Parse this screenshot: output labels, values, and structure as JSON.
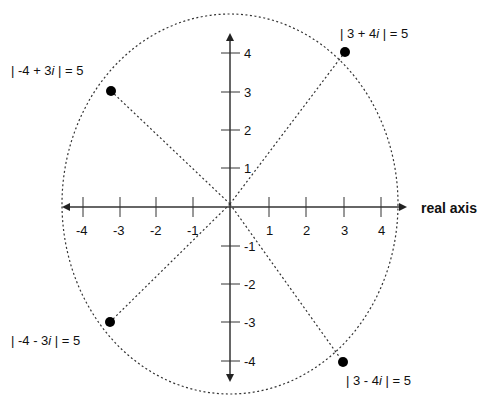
{
  "diagram": {
    "title_partial": "imaginary axis",
    "x_axis_label": "real axis",
    "x_ticks": [
      "-4",
      "-3",
      "-2",
      "-1",
      "1",
      "2",
      "3",
      "4"
    ],
    "y_ticks": [
      "4",
      "3",
      "2",
      "1",
      "-1",
      "-2",
      "-3",
      "-4"
    ],
    "points": [
      {
        "label_pre": "| 3 + 4",
        "label_i": "i",
        "label_post": " | = 5",
        "re": 3,
        "im": 4
      },
      {
        "label_pre": "| -4 + 3",
        "label_i": "i",
        "label_post": " | = 5",
        "re": -4,
        "im": 3
      },
      {
        "label_pre": "| -4 - 3",
        "label_i": "i",
        "label_post": " | = 5",
        "re": -4,
        "im": -3
      },
      {
        "label_pre": "| 3 - 4",
        "label_i": "i",
        "label_post": " | = 5",
        "re": 3,
        "im": -4
      }
    ],
    "circle_radius": 5,
    "colors": {
      "line": "#222222",
      "point": "#000000"
    }
  }
}
